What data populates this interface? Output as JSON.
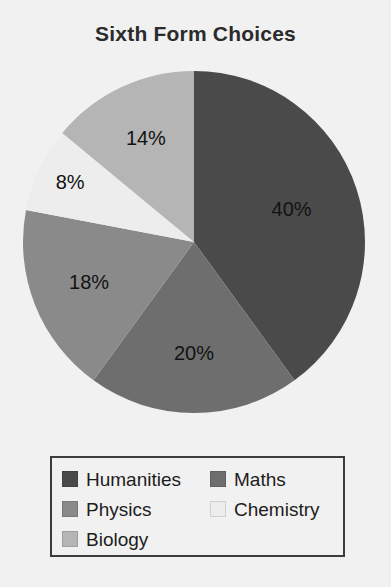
{
  "chart_data": {
    "type": "pie",
    "title": "Sixth Form Choices",
    "xlabel": "",
    "ylabel": "",
    "legend_position": "bottom",
    "grid": false,
    "start_angle_deg": 0,
    "direction": "clockwise",
    "categories": [
      "Humanities",
      "Maths",
      "Physics",
      "Chemistry",
      "Biology"
    ],
    "values": [
      40,
      20,
      18,
      8,
      14
    ],
    "value_unit": "%",
    "data_labels": [
      "40%",
      "20%",
      "18%",
      "8%",
      "14%"
    ],
    "colors": [
      "#4a4a4a",
      "#6e6e6e",
      "#8a8a8a",
      "#ededed",
      "#b5b5b5"
    ],
    "slices": [
      {
        "label": "Humanities",
        "value": 40,
        "display": "40%",
        "color": "#4a4a4a"
      },
      {
        "label": "Maths",
        "value": 20,
        "display": "20%",
        "color": "#6e6e6e"
      },
      {
        "label": "Physics",
        "value": 18,
        "display": "18%",
        "color": "#8a8a8a"
      },
      {
        "label": "Chemistry",
        "value": 8,
        "display": "8%",
        "color": "#ededed"
      },
      {
        "label": "Biology",
        "value": 14,
        "display": "14%",
        "color": "#b5b5b5"
      }
    ]
  },
  "legend": {
    "items": [
      {
        "label": "Humanities",
        "color": "#4a4a4a"
      },
      {
        "label": "Maths",
        "color": "#6e6e6e"
      },
      {
        "label": "Physics",
        "color": "#8a8a8a"
      },
      {
        "label": "Chemistry",
        "color": "#ededed"
      },
      {
        "label": "Biology",
        "color": "#b5b5b5"
      }
    ]
  },
  "page": {
    "background": "#f1f1f1",
    "title_color": "#2b2b2b",
    "label_color": "#121212",
    "legend_border_color": "#3c3c3c"
  }
}
